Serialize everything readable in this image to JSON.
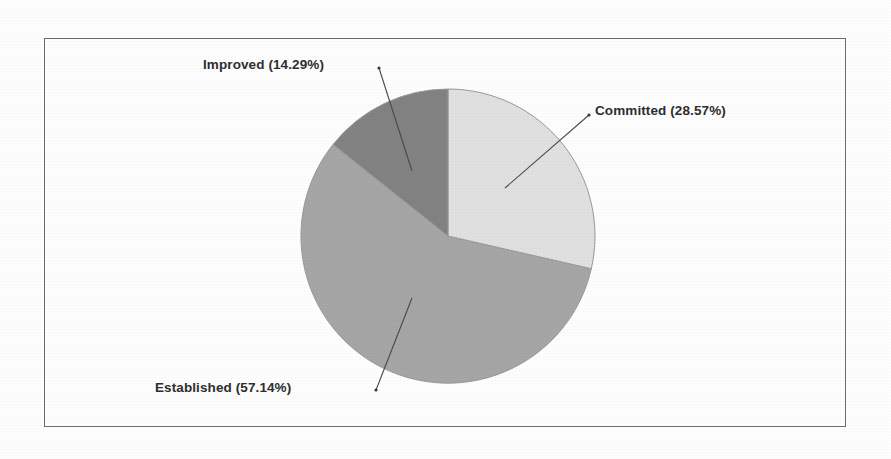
{
  "chart_data": {
    "type": "pie",
    "title": "",
    "subtitle": "",
    "xlabel": "",
    "ylabel": "",
    "grid": false,
    "legend_position": "none",
    "label_format": "name (percent%)",
    "start_angle_deg": 0,
    "direction": "clockwise",
    "categories": [
      "Committed",
      "Established",
      "Improved"
    ],
    "values": [
      28.57,
      57.14,
      14.29
    ],
    "slices": [
      {
        "name": "Committed",
        "percent": 28.57,
        "label": "Committed (28.57%)",
        "color": "#e2e2e2",
        "start_angle_deg": 0,
        "end_angle_deg": 102.85
      },
      {
        "name": "Established",
        "percent": 57.14,
        "label": "Established (57.14%)",
        "color": "#a7a7a7",
        "start_angle_deg": 102.85,
        "end_angle_deg": 308.56
      },
      {
        "name": "Improved",
        "percent": 14.29,
        "label": "Improved (14.29%)",
        "color": "#838383",
        "start_angle_deg": 308.56,
        "end_angle_deg": 360
      }
    ]
  },
  "figure": {
    "frame_color": "#6e6e6e",
    "background_color": "#ffffff",
    "label_color": "#2f2f2f",
    "leader_line_color": "#4a4a4a",
    "slice_outline_color": "#9a9a9a"
  },
  "labels": {
    "improved": "Improved (14.29%)",
    "committed": "Committed (28.57%)",
    "established": "Established (57.14%)"
  }
}
